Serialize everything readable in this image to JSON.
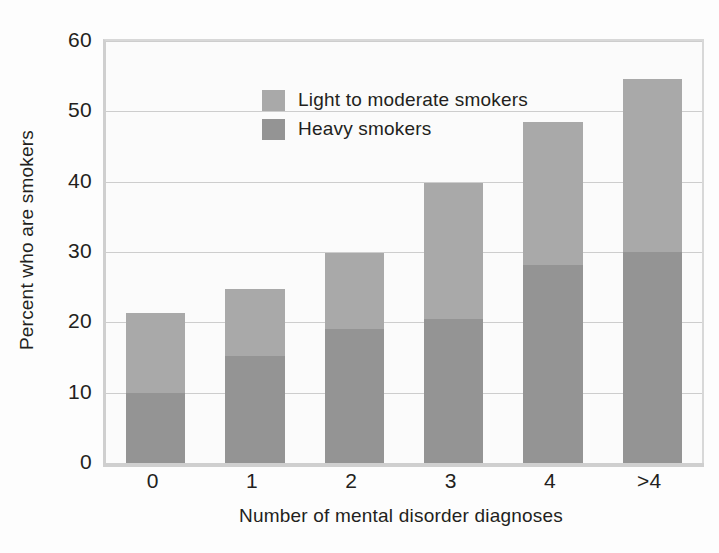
{
  "chart_data": {
    "type": "bar",
    "subtype": "stacked",
    "title": "",
    "xlabel": "Number of mental disorder diagnoses",
    "ylabel": "Percent who are smokers",
    "categories": [
      "0",
      "1",
      "2",
      "3",
      "4",
      ">4"
    ],
    "series": [
      {
        "name": "Heavy smokers",
        "color": "#949494",
        "values": [
          10.0,
          15.2,
          19.0,
          20.5,
          28.2,
          30.0
        ]
      },
      {
        "name": "Light to moderate smokers",
        "color": "#a9a9a9",
        "values": [
          11.3,
          9.6,
          10.8,
          19.3,
          20.3,
          24.6
        ]
      }
    ],
    "totals": [
      21.3,
      24.8,
      29.8,
      39.8,
      48.5,
      54.6
    ],
    "ylim": [
      0,
      60
    ],
    "yticks": [
      0,
      10,
      20,
      30,
      40,
      50,
      60
    ],
    "ytick_labels": [
      "0",
      "10",
      "20",
      "30",
      "40",
      "50",
      "60"
    ],
    "grid": true,
    "legend_position": "top-left",
    "legend": [
      {
        "label": "Light to moderate smokers",
        "color": "#a9a9a9"
      },
      {
        "label": "Heavy smokers",
        "color": "#949494"
      }
    ]
  }
}
